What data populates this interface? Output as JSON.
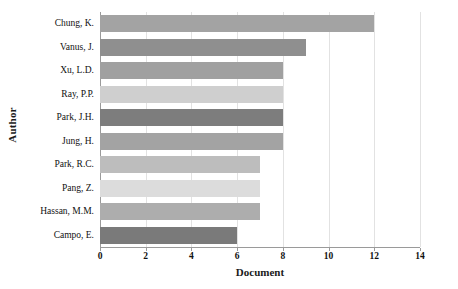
{
  "chart_data": {
    "type": "bar",
    "orientation": "horizontal",
    "title": "",
    "xlabel": "Document",
    "ylabel": "Author",
    "categories": [
      "Chung, K.",
      "Vanus, J.",
      "Xu, L.D.",
      "Ray, P.P.",
      "Park, J.H.",
      "Jung, H.",
      "Park, R.C.",
      "Pang, Z.",
      "Hassan, M.M.",
      "Campo, E."
    ],
    "values": [
      12,
      9,
      8,
      8,
      8,
      8,
      7,
      7,
      7,
      6
    ],
    "bar_colors": [
      "#a3a3a3",
      "#8f8f8f",
      "#a0a0a0",
      "#cfcfcf",
      "#7d7d7d",
      "#a3a3a3",
      "#bdbdbd",
      "#dcdcdc",
      "#adadad",
      "#7a7a7a"
    ],
    "xlim": [
      0,
      14
    ],
    "xticks": [
      0,
      2,
      4,
      6,
      8,
      10,
      12,
      14
    ],
    "xticklabels": [
      "0",
      "2",
      "4",
      "6",
      "8",
      "10",
      "12",
      "14"
    ],
    "grid": true,
    "grid_axis": "x",
    "grid_color": "#e2e2e2",
    "legend": null,
    "axis_color": "#9a9a9a",
    "background": "#ffffff"
  }
}
